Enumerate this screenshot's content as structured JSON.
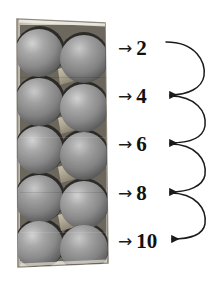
{
  "figure": {
    "background_color": "#ffffff",
    "width": 218,
    "height": 281
  },
  "photo": {
    "subject": "egg-carton",
    "description": "Grayscale photograph of an open egg carton holding ten eggs arranged in five rows of two",
    "egg_count": 10,
    "rows": 5,
    "columns": 2,
    "palette": {
      "egg_base": "#8f8f8f",
      "egg_highlight": "#cfcfcf",
      "egg_shadow": "#3a3a3a",
      "carton_body": "#c9c4b8",
      "carton_cone": "#b4ab98",
      "carton_shadow": "#262626",
      "carton_edge": "#9a948a"
    }
  },
  "counts": {
    "arrow_glyph": "→",
    "items": [
      {
        "label": "2",
        "value": 2
      },
      {
        "label": "4",
        "value": 4
      },
      {
        "label": "6",
        "value": 6
      },
      {
        "label": "8",
        "value": 8
      },
      {
        "label": "10",
        "value": 10
      }
    ]
  },
  "connectors": {
    "count": 4,
    "style": "curved-s-arrow",
    "color": "#1a1a1a",
    "description": "Curved arrows looping from each count to the next count below"
  }
}
